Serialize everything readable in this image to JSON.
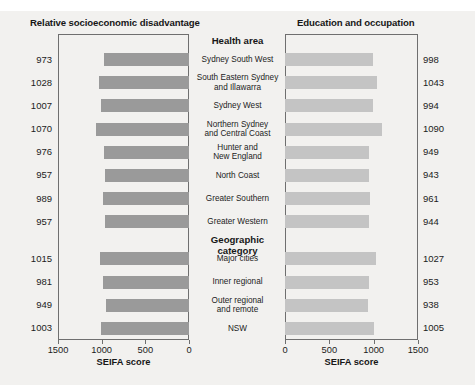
{
  "caption": {
    "text": ""
  },
  "panels": {
    "left": {
      "title": "Relative socioeconomic disadvantage",
      "axis_title": "SEIFA score",
      "tick_labels": [
        "1500",
        "1000",
        "500",
        "0"
      ]
    },
    "right": {
      "title": "Education and occupation",
      "axis_title": "SEIFA score",
      "tick_labels": [
        "0",
        "500",
        "1000",
        "1500"
      ]
    }
  },
  "sections": [
    {
      "header": "Health area",
      "count": 8
    },
    {
      "header": "Geographic category",
      "count": 4
    }
  ],
  "categories": [
    "Sydney South West",
    "South Eastern Sydney\nand Illawarra",
    "Sydney West",
    "Northern Sydney\nand Central Coast",
    "Hunter and\nNew England",
    "North Coast",
    "Greater Southern",
    "Greater Western",
    "Major cities",
    "Inner regional",
    "Outer regional\nand remote",
    "NSW"
  ],
  "chart_data": {
    "type": "bar",
    "orientation": "horizontal",
    "layout": "mirrored-pyramid",
    "xlabel": "SEIFA score",
    "ylabel": "",
    "xlim": [
      0,
      1500
    ],
    "grid": false,
    "legend": "none",
    "categories": [
      "Sydney South West",
      "South Eastern Sydney and Illawarra",
      "Sydney West",
      "Northern Sydney and Central Coast",
      "Hunter and New England",
      "North Coast",
      "Greater Southern",
      "Greater Western",
      "Major cities",
      "Inner regional",
      "Outer regional and remote",
      "NSW"
    ],
    "group_of_category": [
      "Health area",
      "Health area",
      "Health area",
      "Health area",
      "Health area",
      "Health area",
      "Health area",
      "Health area",
      "Geographic category",
      "Geographic category",
      "Geographic category",
      "Geographic category"
    ],
    "series": [
      {
        "name": "Relative socioeconomic disadvantage",
        "axis": "left",
        "axis_direction": "reversed",
        "axis_ticks": [
          1500,
          1000,
          500,
          0
        ],
        "color": "#9a9a9a",
        "values": [
          973,
          1028,
          1007,
          1070,
          976,
          957,
          989,
          957,
          1015,
          981,
          949,
          1003
        ]
      },
      {
        "name": "Education and occupation",
        "axis": "right",
        "axis_direction": "normal",
        "axis_ticks": [
          0,
          500,
          1000,
          1500
        ],
        "color": "#c4c4c4",
        "values": [
          998,
          1043,
          994,
          1090,
          949,
          943,
          961,
          944,
          1027,
          953,
          938,
          1005
        ]
      }
    ]
  }
}
